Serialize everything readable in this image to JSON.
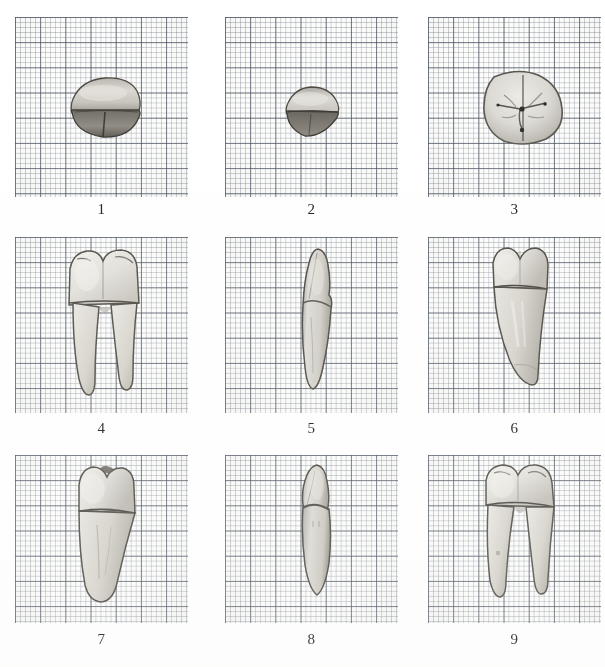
{
  "plate": {
    "title": "Tooth specimen plate on graph paper",
    "background_color": "#ffffff",
    "paper_color": "#fdfdfc",
    "grid_fine_color": "#788090",
    "grid_bold_color": "#464e5c",
    "specimen_color": "#d8d6d0",
    "grid_fine_spacing_px": 5,
    "grid_bold_spacing_px": 25,
    "rows": 3,
    "columns": 3
  },
  "panels": [
    {
      "number": "1",
      "caption": "1",
      "view": "occlusal-incisal-view-small-tooth",
      "x": 15,
      "y": 17,
      "w": 173,
      "h": 180,
      "caption_y": 202
    },
    {
      "number": "2",
      "caption": "2",
      "view": "occlusal-view-small-tooth",
      "x": 225,
      "y": 17,
      "w": 173,
      "h": 180,
      "caption_y": 202
    },
    {
      "number": "3",
      "caption": "3",
      "view": "occlusal-view-molar",
      "x": 428,
      "y": 17,
      "w": 173,
      "h": 180,
      "caption_y": 202
    },
    {
      "number": "4",
      "caption": "4",
      "view": "buccal-view-two-rooted-molar",
      "x": 15,
      "y": 237,
      "w": 173,
      "h": 176,
      "caption_y": 421
    },
    {
      "number": "5",
      "caption": "5",
      "view": "proximal-view-narrow-tooth",
      "x": 225,
      "y": 237,
      "w": 173,
      "h": 176,
      "caption_y": 421
    },
    {
      "number": "6",
      "caption": "6",
      "view": "labial-view-single-rooted-tooth",
      "x": 428,
      "y": 237,
      "w": 173,
      "h": 176,
      "caption_y": 421
    },
    {
      "number": "7",
      "caption": "7",
      "view": "buccal-view-single-rooted-premolar",
      "x": 15,
      "y": 455,
      "w": 173,
      "h": 168,
      "caption_y": 632
    },
    {
      "number": "8",
      "caption": "8",
      "view": "proximal-view-narrow-tooth",
      "x": 225,
      "y": 455,
      "w": 173,
      "h": 168,
      "caption_y": 632
    },
    {
      "number": "9",
      "caption": "9",
      "view": "buccal-view-two-rooted-molar",
      "x": 428,
      "y": 455,
      "w": 173,
      "h": 168,
      "caption_y": 632
    }
  ]
}
